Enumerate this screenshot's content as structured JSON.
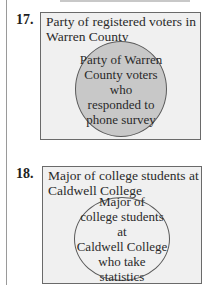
{
  "problems": [
    {
      "number": "17.",
      "population_label": "Party of registered voters in Warren County",
      "population_lines": [
        "Party of registered voters in",
        "Warren County"
      ],
      "sample_label": "Party of Warren County voters who responded to phone survey",
      "sample_text": "Party of Warren\nCounty voters who\nresponded to\nphone survey",
      "circle_fill": "#c8c8c8",
      "box_fill": "#f0f0f0"
    },
    {
      "number": "18.",
      "population_label": "Major of college students at Caldwell College",
      "population_lines": [
        "Major of college students at",
        "Caldwell College"
      ],
      "sample_label": "Major of college students at Caldwell College who take statistics",
      "sample_text": "Major of\ncollege students at\nCaldwell College\nwho take\nstatistics",
      "circle_fill": "#f0f0f0",
      "box_fill": "#f0f0f0"
    }
  ]
}
